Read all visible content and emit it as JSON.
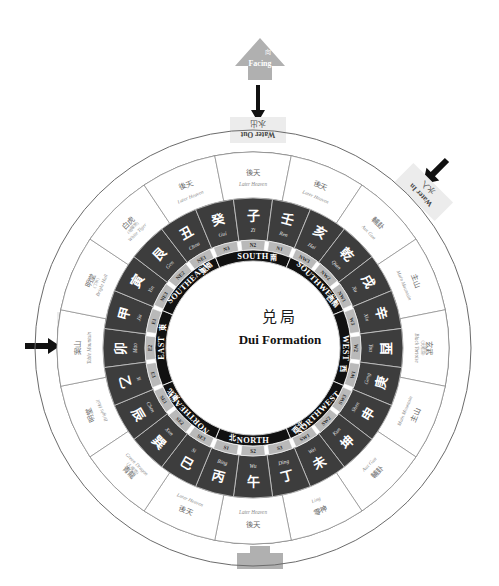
{
  "title": {
    "han": "兑局",
    "en": "Dui Formation"
  },
  "annotations": {
    "facing": {
      "han": "向",
      "en": "Facing"
    },
    "water_out": {
      "han": "水出",
      "en": "Water Out"
    },
    "water_in_left": {
      "han": "水入",
      "en": "Water In"
    },
    "water_in_right": {
      "han": "水入",
      "en": "Water In"
    }
  },
  "cardinals": [
    {
      "en": "EAST",
      "han": "東",
      "angle": -90
    },
    {
      "en": "SOUTHEAST",
      "han": "東南",
      "angle": -45
    },
    {
      "en": "SOUTH",
      "han": "南",
      "angle": 0
    },
    {
      "en": "SOUTHWEST",
      "han": "西南",
      "angle": 45
    },
    {
      "en": "WEST",
      "han": "西",
      "angle": 90
    },
    {
      "en": "NORTHWEST",
      "han": "西北",
      "angle": 135
    },
    {
      "en": "NORTH",
      "han": "北",
      "angle": 180
    },
    {
      "en": "NORTHEAST",
      "han": "東北",
      "angle": -135
    }
  ],
  "subsectors": [
    "E2",
    "E1",
    "NE3",
    "NE2",
    "NE1",
    "N3",
    "N2",
    "N1",
    "NW3",
    "NW2",
    "NW1",
    "W3",
    "W2",
    "W1",
    "SW3",
    "SW2",
    "SW1",
    "S3",
    "S2",
    "S1",
    "SE3",
    "SE2",
    "SE1",
    "E3"
  ],
  "mountains": [
    {
      "han": "卯",
      "pinyin": "Mao"
    },
    {
      "han": "甲",
      "pinyin": "Jia"
    },
    {
      "han": "寅",
      "pinyin": "Yin"
    },
    {
      "han": "艮",
      "pinyin": "Gen"
    },
    {
      "han": "丑",
      "pinyin": "Chou"
    },
    {
      "han": "癸",
      "pinyin": "Gui"
    },
    {
      "han": "子",
      "pinyin": "Zi"
    },
    {
      "han": "壬",
      "pinyin": "Ren"
    },
    {
      "han": "亥",
      "pinyin": "Hai"
    },
    {
      "han": "乾",
      "pinyin": "Qian"
    },
    {
      "han": "戌",
      "pinyin": "Xu"
    },
    {
      "han": "辛",
      "pinyin": "Xin"
    },
    {
      "han": "酉",
      "pinyin": "You"
    },
    {
      "han": "庚",
      "pinyin": "Geng"
    },
    {
      "han": "申",
      "pinyin": "Shen"
    },
    {
      "han": "坤",
      "pinyin": "Kun"
    },
    {
      "han": "未",
      "pinyin": "Wei"
    },
    {
      "han": "丁",
      "pinyin": "Ding"
    },
    {
      "han": "午",
      "pinyin": "Wu"
    },
    {
      "han": "丙",
      "pinyin": "Bing"
    },
    {
      "han": "巳",
      "pinyin": "Si"
    },
    {
      "han": "巽",
      "pinyin": "Xun"
    },
    {
      "han": "辰",
      "pinyin": "Chen"
    },
    {
      "han": "乙",
      "pinyin": "Yi"
    }
  ],
  "outer_ring": [
    {
      "han": "明堂",
      "en": "Bright Hall",
      "sub": ""
    },
    {
      "han": "案山",
      "en": "Table Mountain",
      "sub": ""
    },
    {
      "han": "明堂",
      "en": "Bright Hall",
      "sub": "(丁水)"
    },
    {
      "han": "白虎",
      "en": "White Tiger",
      "sub": "(地曜煞)"
    },
    {
      "han": "後天",
      "en": "Later Heaven",
      "sub": ""
    },
    {
      "han": "後天",
      "en": "Later Heaven",
      "sub": ""
    },
    {
      "han": "後天",
      "en": "Later Heaven",
      "sub": ""
    },
    {
      "han": "輔卦",
      "en": "Aux Gua",
      "sub": ""
    },
    {
      "han": "主山",
      "en": "Main Mountain",
      "sub": ""
    },
    {
      "han": "玄武",
      "en": "Black Tortoise",
      "sub": "(天曜煞)"
    },
    {
      "han": "主山",
      "en": "Main Mountain",
      "sub": ""
    },
    {
      "han": "輔卦",
      "en": "Aux Gua",
      "sub": ""
    },
    {
      "han": "零神",
      "en": "Ling",
      "sub": ""
    },
    {
      "han": "後天",
      "en": "Later Heaven",
      "sub": ""
    },
    {
      "han": "後天",
      "en": "Later Heaven",
      "sub": ""
    },
    {
      "han": "青龍",
      "en": "Green Dragon",
      "sub": "(人曜煞)"
    }
  ],
  "colors": {
    "dark_cell": "#3d3d3d",
    "black_ring": "#111111",
    "grey_sub": "#b9b9b9",
    "accent_grey": "#b0b0b0",
    "line": "#6b6b6b"
  }
}
